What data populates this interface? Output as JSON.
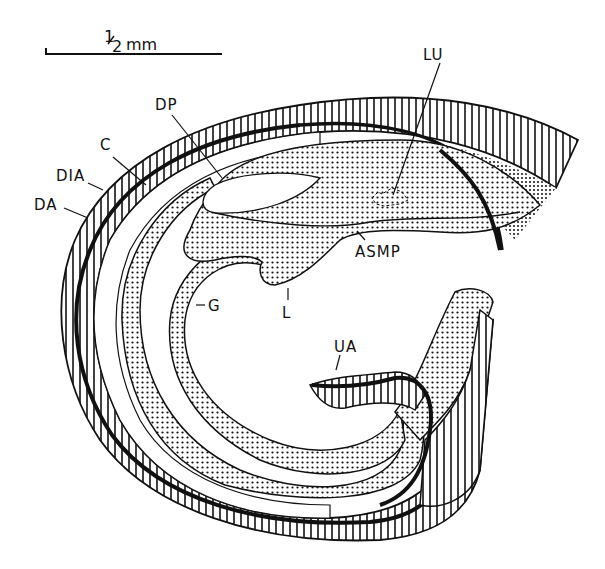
{
  "figure": {
    "scale_bar": {
      "label_num": "1",
      "label_den": "2",
      "label_unit": "mm",
      "text": "1/2 mm"
    },
    "labels": {
      "LU": "LU",
      "DP": "DP",
      "C": "C",
      "DIA": "DIA",
      "DA": "DA",
      "ASMP": "ASMP",
      "G": "G",
      "L": "L",
      "UA": "UA"
    },
    "colors": {
      "ink": "#111111",
      "background": "#ffffff"
    }
  }
}
